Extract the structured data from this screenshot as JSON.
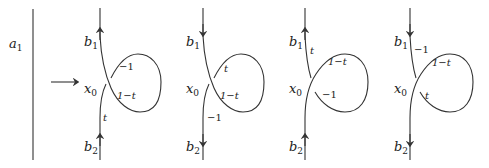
{
  "left": {
    "label_base": "a",
    "label_sub": "1"
  },
  "arrow": {
    "direction": "right"
  },
  "panels": [
    {
      "b1": {
        "base": "b",
        "sub": "1"
      },
      "x0": {
        "base": "x",
        "sub": "0"
      },
      "b2": {
        "base": "b",
        "sub": "2"
      },
      "orientation": "up",
      "weights": {
        "upper_strand": "",
        "lower_strand": "t",
        "loop_upper": "−1",
        "loop_lower": "1−t"
      }
    },
    {
      "b1": {
        "base": "b",
        "sub": "1"
      },
      "x0": {
        "base": "x",
        "sub": "0"
      },
      "b2": {
        "base": "b",
        "sub": "2"
      },
      "orientation": "down",
      "weights": {
        "upper_strand": "",
        "lower_strand": "−1",
        "loop_upper": "t",
        "loop_lower": "1−t"
      }
    },
    {
      "b1": {
        "base": "b",
        "sub": "1"
      },
      "x0": {
        "base": "x",
        "sub": "0"
      },
      "b2": {
        "base": "b",
        "sub": "2"
      },
      "orientation": "up",
      "weights": {
        "upper_strand": "t",
        "lower_strand": "",
        "loop_upper": "1−t",
        "loop_lower": "−1"
      }
    },
    {
      "b1": {
        "base": "b",
        "sub": "1"
      },
      "x0": {
        "base": "x",
        "sub": "0"
      },
      "b2": {
        "base": "b",
        "sub": "2"
      },
      "orientation": "down",
      "weights": {
        "upper_strand": "−1",
        "lower_strand": "",
        "loop_upper": "1−t",
        "loop_lower": "t"
      }
    }
  ]
}
